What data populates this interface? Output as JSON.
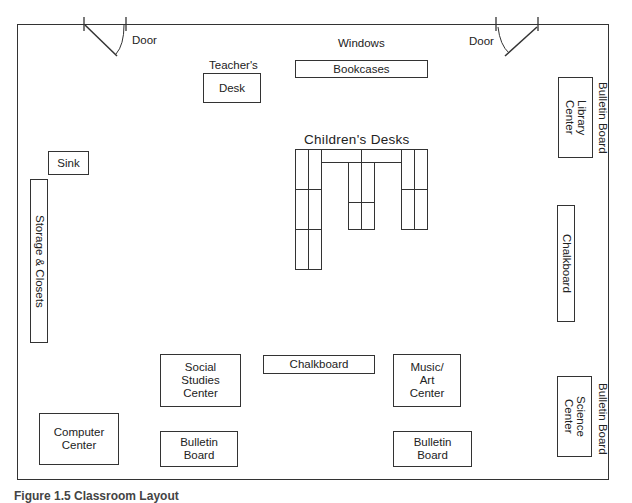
{
  "diagram": {
    "labels": {
      "door_left": "Door",
      "door_right": "Door",
      "windows": "Windows",
      "teachers": "Teacher's",
      "desk": "Desk",
      "bookcases": "Bookcases",
      "childrens_desks": "Children's Desks",
      "sink": "Sink",
      "storage": "Storage & Closets",
      "library_center_1": "Library",
      "library_center_2": "Center",
      "bulletin_board_right_top": "Bulletin Board",
      "chalkboard_right": "Chalkboard",
      "chalkboard_bottom": "Chalkboard",
      "social_studies_1": "Social",
      "social_studies_2": "Studies",
      "social_studies_3": "Center",
      "music_art_1": "Music/",
      "music_art_2": "Art",
      "music_art_3": "Center",
      "bulletin_left_1": "Bulletin",
      "bulletin_left_2": "Board",
      "bulletin_right_1": "Bulletin",
      "bulletin_right_2": "Board",
      "computer_1": "Computer",
      "computer_2": "Center",
      "science_1": "Science",
      "science_2": "Center",
      "bulletin_board_right_bottom": "Bulletin Board"
    },
    "caption": "Figure 1.5  Classroom Layout"
  }
}
